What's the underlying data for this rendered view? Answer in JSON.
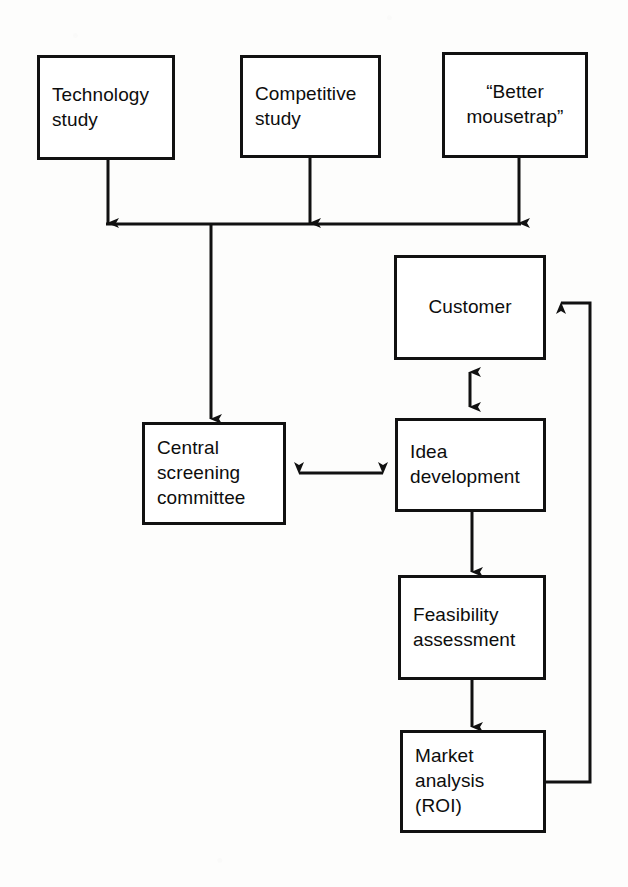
{
  "diagram": {
    "type": "flowchart",
    "colors": {
      "stroke": "#111111",
      "box_fill": "#ffffff",
      "page_background": "#fdfdfc",
      "text": "#0d0d0d"
    },
    "nodes": [
      {
        "id": "technology-study",
        "label": "Technology\nstudy",
        "align": "left",
        "x": 37,
        "y": 55,
        "w": 138,
        "h": 105
      },
      {
        "id": "competitive-study",
        "label": "Competitive\nstudy",
        "align": "left",
        "x": 240,
        "y": 55,
        "w": 141,
        "h": 103
      },
      {
        "id": "better-mousetrap",
        "label": "“Better\nmousetrap”",
        "align": "center",
        "x": 442,
        "y": 52,
        "w": 146,
        "h": 106
      },
      {
        "id": "central-screening-committee",
        "label": "Central\nscreening\ncommittee",
        "align": "left",
        "x": 142,
        "y": 422,
        "w": 144,
        "h": 103
      },
      {
        "id": "customer",
        "label": "Customer",
        "align": "center",
        "x": 394,
        "y": 255,
        "w": 152,
        "h": 105
      },
      {
        "id": "idea-development",
        "label": "Idea\ndevelopment",
        "align": "left",
        "x": 395,
        "y": 418,
        "w": 151,
        "h": 94
      },
      {
        "id": "feasibility-assessment",
        "label": "Feasibility\nassessment",
        "align": "left",
        "x": 398,
        "y": 575,
        "w": 148,
        "h": 105
      },
      {
        "id": "market-analysis",
        "label": "Market\nanalysis\n(ROI)",
        "align": "left",
        "x": 400,
        "y": 730,
        "w": 146,
        "h": 103
      }
    ],
    "edges": [
      {
        "id": "technology-study-to-bus",
        "from": "technology-study",
        "to": "collector-bus",
        "kind": "arrow-down"
      },
      {
        "id": "competitive-study-to-bus",
        "from": "competitive-study",
        "to": "collector-bus",
        "kind": "arrow-down"
      },
      {
        "id": "better-mousetrap-to-bus",
        "from": "better-mousetrap",
        "to": "collector-bus",
        "kind": "arrow-down"
      },
      {
        "id": "bus-to-central-screening-committee",
        "from": "collector-bus",
        "to": "central-screening-committee",
        "kind": "arrow-down"
      },
      {
        "id": "central-screening-committee-to-idea-development",
        "from": "central-screening-committee",
        "to": "idea-development",
        "kind": "double-arrow-horizontal"
      },
      {
        "id": "customer-to-idea-development",
        "from": "customer",
        "to": "idea-development",
        "kind": "double-arrow-vertical"
      },
      {
        "id": "idea-development-to-feasibility-assessment",
        "from": "idea-development",
        "to": "feasibility-assessment",
        "kind": "arrow-down"
      },
      {
        "id": "feasibility-assessment-to-market-analysis",
        "from": "feasibility-assessment",
        "to": "market-analysis",
        "kind": "arrow-down"
      },
      {
        "id": "market-analysis-to-customer-feedback",
        "from": "market-analysis",
        "to": "customer",
        "kind": "feedback-loop-right"
      }
    ]
  }
}
